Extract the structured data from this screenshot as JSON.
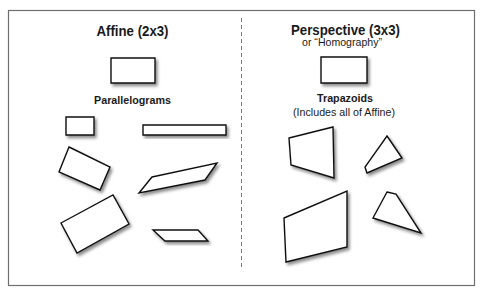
{
  "diagram": {
    "affine": {
      "title": "Affine (2x3)",
      "label": "Parallelograms",
      "reference_shape": "111,58 155,58 155,83 111,83",
      "shapes": [
        "66,117 94,117 94,135 66,135",
        "143,125 226,125 226,135 143,135",
        "69,147 110,167 100,190 59,172",
        "152,177 217,163 205,180 139,193",
        "61,223 113,195 129,224 77,253",
        "153,230 198,230 208,241 165,241"
      ]
    },
    "perspective": {
      "title": "Perspective (3x3)",
      "subtitle": "or “Homography”",
      "label": "Trapazoids",
      "sublabel": "(Includes all of Affine)",
      "reference_shape": "321,57 367,57 367,83 321,83",
      "shapes": [
        "289,138 333,127 334,178 291,165",
        "387,136 402,158 367,173 365,167",
        "284,218 347,191 347,247 286,262",
        "387,192 396,194 421,233 373,218"
      ]
    },
    "colors": {
      "frame": "#6e6e6e",
      "stroke": "#111111",
      "fill": "#ffffff"
    }
  }
}
